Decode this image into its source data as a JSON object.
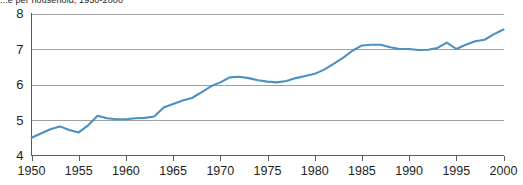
{
  "chart_data": {
    "type": "line",
    "title": "...e per household, 1950-2000",
    "xlabel": "",
    "ylabel": "",
    "xlim": [
      1950,
      2000
    ],
    "ylim": [
      4,
      8
    ],
    "grid": true,
    "legend": "none",
    "line_color": "#4a90c4",
    "axis_color": "#58595b",
    "grid_color": "#939598",
    "text_color": "#231f20",
    "ytick_labels": [
      "8",
      "7",
      "6",
      "5",
      "4"
    ],
    "ytick_values": [
      8,
      7,
      6,
      5,
      4
    ],
    "xtick_labels": [
      "1950",
      "1955",
      "1960",
      "1965",
      "1970",
      "1975",
      "1980",
      "1985",
      "1990",
      "1995",
      "2000"
    ],
    "xtick_values": [
      1950,
      1955,
      1960,
      1965,
      1970,
      1975,
      1980,
      1985,
      1990,
      1995,
      2000
    ],
    "x": [
      1950,
      1951,
      1952,
      1953,
      1954,
      1955,
      1956,
      1957,
      1958,
      1959,
      1960,
      1961,
      1962,
      1963,
      1964,
      1965,
      1966,
      1967,
      1968,
      1969,
      1970,
      1971,
      1972,
      1973,
      1974,
      1975,
      1976,
      1977,
      1978,
      1979,
      1980,
      1981,
      1982,
      1983,
      1984,
      1985,
      1986,
      1987,
      1988,
      1989,
      1990,
      1991,
      1992,
      1993,
      1994,
      1995,
      1996,
      1997,
      1998,
      1999,
      2000
    ],
    "values": [
      4.5,
      4.62,
      4.74,
      4.82,
      4.72,
      4.65,
      4.85,
      5.12,
      5.05,
      5.02,
      5.02,
      5.05,
      5.06,
      5.1,
      5.35,
      5.45,
      5.55,
      5.62,
      5.78,
      5.95,
      6.06,
      6.2,
      6.22,
      6.18,
      6.12,
      6.08,
      6.06,
      6.1,
      6.18,
      6.24,
      6.3,
      6.42,
      6.58,
      6.75,
      6.95,
      7.1,
      7.12,
      7.12,
      7.05,
      7.0,
      7.0,
      6.97,
      6.98,
      7.03,
      7.18,
      7.0,
      7.12,
      7.22,
      7.26,
      7.42,
      7.55
    ],
    "series_name": "value"
  }
}
